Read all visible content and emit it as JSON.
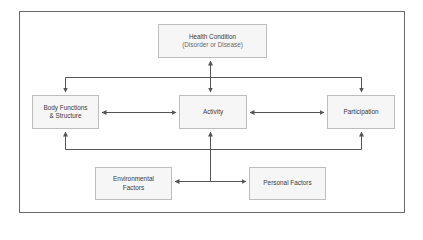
{
  "diagram": {
    "type": "ICF framework flow diagram",
    "nodes": {
      "health_condition": {
        "title": "Health Condition",
        "subtitle": "(Disorder or Disease)"
      },
      "body_functions": {
        "line1": "Body Functions",
        "line2": "& Structure"
      },
      "activity": {
        "title": "Activity"
      },
      "participation": {
        "title": "Participation"
      },
      "environmental": {
        "line1": "Environmental",
        "line2": "Factors"
      },
      "personal": {
        "title": "Personal Factors"
      }
    },
    "edges": [
      {
        "from": "health_condition",
        "to": "activity",
        "direction": "both"
      },
      {
        "from": "health_condition",
        "to": "body_functions",
        "direction": "forward"
      },
      {
        "from": "health_condition",
        "to": "participation",
        "direction": "forward"
      },
      {
        "from": "body_functions",
        "to": "activity",
        "direction": "both"
      },
      {
        "from": "activity",
        "to": "participation",
        "direction": "both"
      },
      {
        "from": "contextual_factors",
        "to": "body_functions",
        "direction": "forward"
      },
      {
        "from": "contextual_factors",
        "to": "activity",
        "direction": "forward"
      },
      {
        "from": "contextual_factors",
        "to": "participation",
        "direction": "forward"
      },
      {
        "from": "contextual_factors",
        "to": "environmental",
        "direction": "forward"
      },
      {
        "from": "contextual_factors",
        "to": "personal",
        "direction": "forward"
      }
    ],
    "colors": {
      "frame_border": "#6a6a6a",
      "node_border": "#bdbdbd",
      "node_fill": "#f6f6f6",
      "line": "#555555",
      "text": "#3a3a3a"
    }
  }
}
